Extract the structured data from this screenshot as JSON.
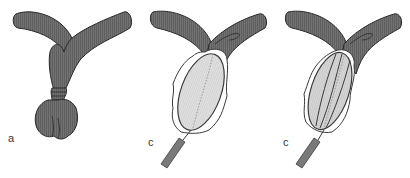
{
  "figure": {
    "panels": [
      {
        "id": "panel-a",
        "label": "a",
        "state": "constricted-organ"
      },
      {
        "id": "panel-c1",
        "label": "c",
        "state": "balloon-inserted"
      },
      {
        "id": "panel-c2",
        "label": "c",
        "state": "balloon-inflated-ribbed"
      }
    ]
  },
  "colors": {
    "organ_fill": "#6e6e6e",
    "organ_stroke": "#2a2a2a",
    "balloon_fill": "#dcdcdc",
    "balloon_stroke": "#3a3a3a",
    "catheter_fill": "#7a7a7a",
    "background": "#ffffff"
  }
}
